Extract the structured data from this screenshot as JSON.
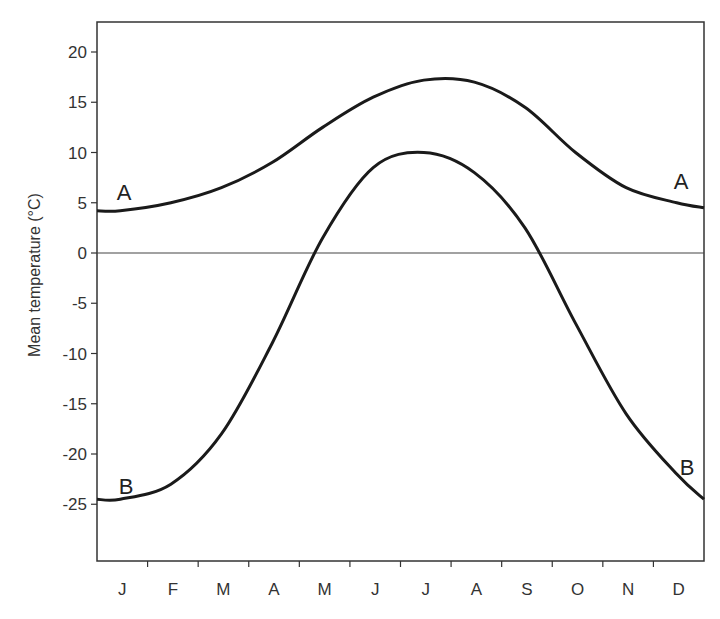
{
  "chart_data": {
    "type": "line",
    "title": "",
    "xlabel": "",
    "ylabel": "Mean temperature (°C)",
    "categories": [
      "J",
      "F",
      "M",
      "A",
      "M",
      "J",
      "J",
      "A",
      "S",
      "O",
      "N",
      "D"
    ],
    "yticks": [
      20,
      15,
      10,
      5,
      0,
      -5,
      -10,
      -15,
      -20,
      -25
    ],
    "ylim": [
      -30,
      23
    ],
    "grid": false,
    "zero_line": true,
    "legend": "inline labels at both ends of each curve",
    "series": [
      {
        "name": "A",
        "values": [
          4.2,
          5.0,
          6.5,
          9.0,
          12.5,
          15.5,
          17.2,
          17.0,
          14.5,
          10.0,
          6.5,
          5.0
        ],
        "end_value": 4.5
      },
      {
        "name": "B",
        "values": [
          -24.5,
          -23.0,
          -18.0,
          -9.0,
          1.5,
          8.5,
          10.0,
          8.0,
          2.5,
          -7.0,
          -16.0,
          -22.0
        ],
        "end_value": -24.5
      }
    ]
  },
  "labels": {
    "series_a_left": "A",
    "series_a_right": "A",
    "series_b_left": "B",
    "series_b_right": "B"
  }
}
